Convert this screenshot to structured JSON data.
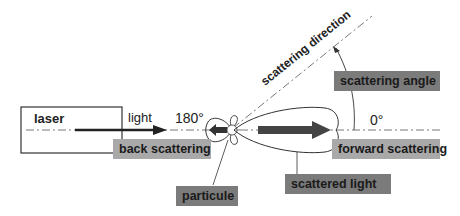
{
  "diagram": {
    "laser_label": "laser",
    "light_label": "light",
    "angle_180": "180°",
    "angle_0": "0°",
    "scattering_direction": "scattering direction",
    "labels": {
      "back_scattering": "back scattering",
      "forward_scattering": "forward scattering",
      "scattering_angle": "scattering angle",
      "scattered_light": "scattered light",
      "particule": "particule"
    },
    "colors": {
      "light_box": "#a9a9a9",
      "dark_box": "#7b7b7b",
      "line": "#333333"
    }
  }
}
